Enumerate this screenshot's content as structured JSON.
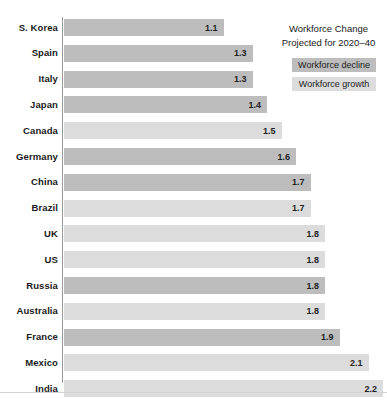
{
  "chart_data": {
    "type": "bar",
    "orientation": "horizontal",
    "title": "",
    "xlabel": "",
    "ylabel": "",
    "xlim": [
      0,
      2.4
    ],
    "grid": false,
    "legend_position": "top-right",
    "categories": [
      "S. Korea",
      "Spain",
      "Italy",
      "Japan",
      "Canada",
      "Germany",
      "China",
      "Brazil",
      "UK",
      "US",
      "Russia",
      "Australia",
      "France",
      "Mexico",
      "India"
    ],
    "values": [
      1.1,
      1.3,
      1.3,
      1.4,
      1.5,
      1.6,
      1.7,
      1.7,
      1.8,
      1.8,
      1.8,
      1.8,
      1.9,
      2.1,
      2.2
    ],
    "value_labels": [
      "1.1",
      "1.3",
      "1.3",
      "1.4",
      "1.5",
      "1.6",
      "1.7",
      "1.7",
      "1.8",
      "1.8",
      "1.8",
      "1.8",
      "1.9",
      "2.1",
      "2.2"
    ],
    "series_groups": [
      "decline",
      "decline",
      "decline",
      "decline",
      "growth",
      "decline",
      "decline",
      "growth",
      "growth",
      "growth",
      "decline",
      "growth",
      "decline",
      "growth",
      "growth"
    ],
    "rows": [
      {
        "label": "S. Korea",
        "value": 1.1,
        "value_label": "1.1",
        "group": "decline"
      },
      {
        "label": "Spain",
        "value": 1.3,
        "value_label": "1.3",
        "group": "decline"
      },
      {
        "label": "Italy",
        "value": 1.3,
        "value_label": "1.3",
        "group": "decline"
      },
      {
        "label": "Japan",
        "value": 1.4,
        "value_label": "1.4",
        "group": "decline"
      },
      {
        "label": "Canada",
        "value": 1.5,
        "value_label": "1.5",
        "group": "growth"
      },
      {
        "label": "Germany",
        "value": 1.6,
        "value_label": "1.6",
        "group": "decline"
      },
      {
        "label": "China",
        "value": 1.7,
        "value_label": "1.7",
        "group": "decline"
      },
      {
        "label": "Brazil",
        "value": 1.7,
        "value_label": "1.7",
        "group": "growth"
      },
      {
        "label": "UK",
        "value": 1.8,
        "value_label": "1.8",
        "group": "growth"
      },
      {
        "label": "US",
        "value": 1.8,
        "value_label": "1.8",
        "group": "growth"
      },
      {
        "label": "Russia",
        "value": 1.8,
        "value_label": "1.8",
        "group": "decline"
      },
      {
        "label": "Australia",
        "value": 1.8,
        "value_label": "1.8",
        "group": "growth"
      },
      {
        "label": "France",
        "value": 1.9,
        "value_label": "1.9",
        "group": "decline"
      },
      {
        "label": "Mexico",
        "value": 2.1,
        "value_label": "2.1",
        "group": "growth"
      },
      {
        "label": "India",
        "value": 2.2,
        "value_label": "2.2",
        "group": "growth"
      }
    ],
    "legend": {
      "title_line1": "Workforce Change",
      "title_line2": "Projected for 2020–40",
      "entries": [
        {
          "key": "decline",
          "label": "Workforce decline",
          "color": "#bdbdbd"
        },
        {
          "key": "growth",
          "label": "Workforce growth",
          "color": "#dcdcdc"
        }
      ]
    },
    "colors": {
      "decline": "#bdbdbd",
      "growth": "#dcdcdc",
      "axis": "#9a9a9a",
      "text": "#1a1a1a",
      "background": "#ffffff"
    }
  },
  "layout": {
    "bar_origin_x": 64,
    "px_per_unit": 145,
    "first_row_top": 19,
    "row_pitch": 25.8,
    "bar_height": 17
  }
}
